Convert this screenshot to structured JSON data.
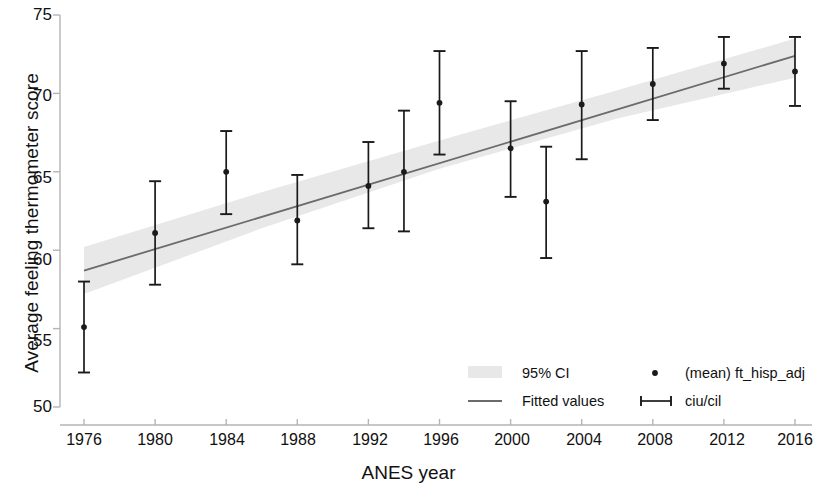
{
  "chart_data": {
    "type": "scatter",
    "title": "",
    "subtitle": "",
    "xlabel": "ANES year",
    "ylabel": "Average feeling thermometer score",
    "xlim": [
      1974,
      2018
    ],
    "ylim": [
      50,
      75
    ],
    "yticks": [
      50,
      55,
      60,
      65,
      70,
      75
    ],
    "xticks": [
      1976,
      1980,
      1984,
      1988,
      1992,
      1996,
      2000,
      2004,
      2008,
      2012,
      2016
    ],
    "grid": false,
    "legend_position": "lower right",
    "series": [
      {
        "name": "(mean) ft_hisp_adj",
        "marker": "point",
        "x": [
          1976,
          1980,
          1984,
          1988,
          1992,
          1994,
          1996,
          2000,
          2002,
          2004,
          2008,
          2012,
          2016
        ],
        "values": [
          55.1,
          61.1,
          65.0,
          61.9,
          64.1,
          65.0,
          69.4,
          66.5,
          63.1,
          69.3,
          70.6,
          71.9,
          71.4
        ],
        "ci_low": [
          52.2,
          57.8,
          62.3,
          59.1,
          61.4,
          61.2,
          66.1,
          63.4,
          59.5,
          65.8,
          68.3,
          70.3,
          69.2
        ],
        "ci_high": [
          58.0,
          64.4,
          67.6,
          64.8,
          66.9,
          68.9,
          72.7,
          69.5,
          66.6,
          72.7,
          72.9,
          73.6,
          73.6
        ]
      },
      {
        "name": "Fitted values",
        "marker": "line",
        "x": [
          1976,
          2016
        ],
        "values": [
          58.7,
          72.4
        ]
      },
      {
        "name": "95% CI",
        "marker": "band",
        "x": [
          1976,
          1986,
          1996,
          2006,
          2016
        ],
        "band_low": [
          57.2,
          61.4,
          65.2,
          68.4,
          71.0
        ],
        "band_high": [
          60.2,
          63.7,
          67.0,
          70.2,
          73.5
        ]
      }
    ]
  },
  "axes": {
    "y_title": "Average feeling thermometer score",
    "x_title": "ANES year",
    "y_tick_labels": [
      "75",
      "70",
      "65",
      "60",
      "55",
      "50"
    ],
    "x_tick_labels": [
      "1976",
      "1980",
      "1984",
      "1988",
      "1992",
      "1996",
      "2000",
      "2004",
      "2008",
      "2012",
      "2016"
    ]
  },
  "legend": {
    "ci_label": "95% CI",
    "fitted_label": "Fitted values",
    "mean_label": "(mean) ft_hisp_adj",
    "errbar_label": "ciu/cil"
  },
  "colors": {
    "marker": "#1a1a1a",
    "errorbar": "#1a1a1a",
    "fitted_line": "#6b6b6b",
    "ci_band": "#e8e8e8",
    "axis": "#b5b5b5",
    "text": "#111111",
    "background": "#ffffff"
  }
}
